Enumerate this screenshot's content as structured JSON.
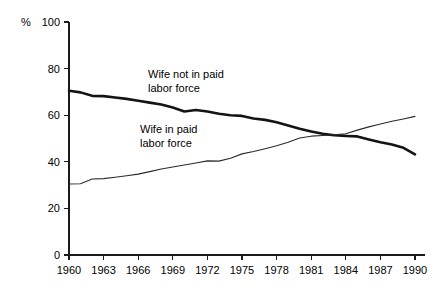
{
  "chart_data": {
    "type": "line",
    "title": "",
    "subtitle": "",
    "xlabel": "",
    "ylabel": "%",
    "unit_label": "%",
    "xlim": [
      1960,
      1990
    ],
    "ylim": [
      0,
      100
    ],
    "grid": false,
    "legend_position": "inline-annotations",
    "x_tick_labels": [
      "1960",
      "1963",
      "1966",
      "1969",
      "1972",
      "1975",
      "1978",
      "1981",
      "1984",
      "1987",
      "1990"
    ],
    "x_ticks": [
      1960,
      1963,
      1966,
      1969,
      1972,
      1975,
      1978,
      1981,
      1984,
      1987,
      1990
    ],
    "y_tick_labels": [
      "0",
      "20",
      "40",
      "60",
      "80",
      "100"
    ],
    "y_ticks": [
      0,
      20,
      40,
      60,
      80,
      100
    ],
    "x": [
      1960,
      1961,
      1962,
      1963,
      1964,
      1965,
      1966,
      1967,
      1968,
      1969,
      1970,
      1971,
      1972,
      1973,
      1974,
      1975,
      1976,
      1977,
      1978,
      1979,
      1980,
      1981,
      1982,
      1983,
      1984,
      1985,
      1986,
      1987,
      1988,
      1989,
      1990
    ],
    "series": [
      {
        "name": "Wife not in paid labor force",
        "style": "thick",
        "color": "#141414",
        "values": [
          70.5,
          69.8,
          68.3,
          68.2,
          67.6,
          67.0,
          66.2,
          65.4,
          64.6,
          63.3,
          61.6,
          62.2,
          61.6,
          60.6,
          60.0,
          59.7,
          58.6,
          58.0,
          57.0,
          55.6,
          54.2,
          53.0,
          52.0,
          51.4,
          51.1,
          50.9,
          49.6,
          48.4,
          47.4,
          46.0,
          43.2
        ]
      },
      {
        "name": "Wife in paid labor force",
        "style": "thin",
        "color": "#2b2b2b",
        "values": [
          30.5,
          30.6,
          32.6,
          32.8,
          33.4,
          34.0,
          34.7,
          35.8,
          36.9,
          37.8,
          38.6,
          39.5,
          40.4,
          40.3,
          41.5,
          43.4,
          44.4,
          45.6,
          46.9,
          48.4,
          50.2,
          51.0,
          51.3,
          51.6,
          52.0,
          53.6,
          55.0,
          56.2,
          57.4,
          58.4,
          59.5
        ]
      }
    ],
    "annotations": [
      {
        "text_line1": "Wife not in paid",
        "text_line2": "labor force",
        "x": 148,
        "y": 78
      },
      {
        "text_line1": "Wife in paid",
        "text_line2": "labor force",
        "x": 140,
        "y": 133
      }
    ],
    "crossing_point": {
      "x": 1980,
      "y": 51
    }
  }
}
